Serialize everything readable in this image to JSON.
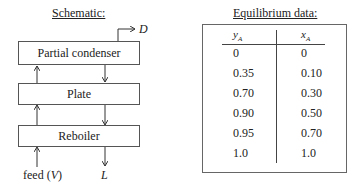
{
  "schematic": {
    "title": "Schematic:",
    "boxes": [
      {
        "label": "Partial condenser"
      },
      {
        "label": "Plate"
      },
      {
        "label": "Reboiler"
      }
    ],
    "streams": {
      "distillate": "D",
      "feed_label": "feed (",
      "feed_var": "V",
      "feed_close": ")",
      "liquid": "L"
    }
  },
  "equilibrium": {
    "title": "Equilibrium data:",
    "columns": [
      {
        "var": "y",
        "sub": "A"
      },
      {
        "var": "x",
        "sub": "A"
      }
    ],
    "rows": [
      [
        "0",
        "0"
      ],
      [
        "0.35",
        "0.10"
      ],
      [
        "0.70",
        "0.30"
      ],
      [
        "0.90",
        "0.50"
      ],
      [
        "0.95",
        "0.70"
      ],
      [
        "1.0",
        "1.0"
      ]
    ]
  }
}
